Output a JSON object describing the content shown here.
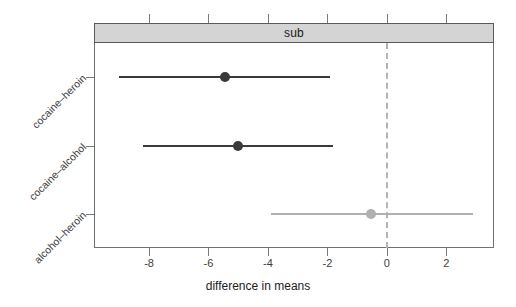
{
  "strip": {
    "label": "sub"
  },
  "axis": {
    "xtitle": "difference in means",
    "xticks": [
      {
        "label": "-8",
        "value": -8
      },
      {
        "label": "-6",
        "value": -6
      },
      {
        "label": "-4",
        "value": -4
      },
      {
        "label": "-2",
        "value": -2
      },
      {
        "label": "0",
        "value": 0
      },
      {
        "label": "2",
        "value": 2
      }
    ],
    "ycats": [
      {
        "label": "cocaine–heroin"
      },
      {
        "label": "cocaine–alcohol"
      },
      {
        "label": "alcohol–heroin"
      }
    ]
  },
  "colors": {
    "dark": "#3a3a3a",
    "light": "#b0b0b0",
    "strip_fill": "#d4d4d4",
    "strip_border": "#5a5a5a",
    "panel_border": "#6f6f6f",
    "refline": "#b4b4b4"
  },
  "chart_data": {
    "type": "scatter",
    "plot_kind": "confidence-interval-dotplot",
    "title": "sub",
    "xlabel": "difference in means",
    "ylabel": "",
    "xlim": [
      -9.85,
      3.6
    ],
    "grid": false,
    "legend": null,
    "reference_line": {
      "x": 0,
      "style": "dashed",
      "color": "#b4b4b4"
    },
    "categories": [
      "cocaine–heroin",
      "cocaine–alcohol",
      "alcohol–heroin"
    ],
    "values": [
      -5.45,
      -5.0,
      -0.55
    ],
    "ci_lower": [
      -9.0,
      -8.2,
      -3.9
    ],
    "ci_upper": [
      -1.9,
      -1.8,
      2.9
    ],
    "points": [
      {
        "category": "cocaine–heroin",
        "estimate": -5.45,
        "lower": -9.0,
        "upper": -1.9,
        "color": "#3a3a3a",
        "significant": true
      },
      {
        "category": "cocaine–alcohol",
        "estimate": -5.0,
        "lower": -8.2,
        "upper": -1.8,
        "color": "#3a3a3a",
        "significant": true
      },
      {
        "category": "alcohol–heroin",
        "estimate": -0.55,
        "lower": -3.9,
        "upper": 2.9,
        "color": "#b0b0b0",
        "significant": false
      }
    ]
  }
}
